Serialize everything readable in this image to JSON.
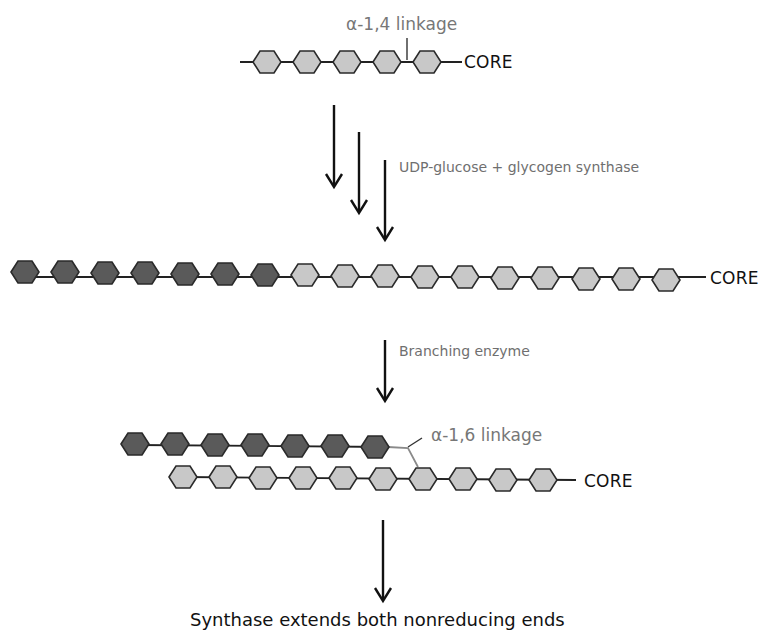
{
  "diagram": {
    "colors": {
      "new_residue": "#5a5a5a",
      "existing_residue": "#c8c8c8",
      "outline": "#2a2a2a",
      "bond": "#222222",
      "branch_bond": "#8a8a8a",
      "label_gray": "#6f6f6f"
    },
    "stage1": {
      "chain_label": "CORE",
      "linkage_label": "α-1,4 linkage",
      "existing_residues": 5,
      "new_residues": 0
    },
    "step1": {
      "label": "UDP-glucose + glycogen synthase",
      "arrow_count": 3
    },
    "stage2": {
      "chain_label": "CORE",
      "new_residues": 7,
      "existing_residues": 11
    },
    "step2": {
      "label": "Branching enzyme"
    },
    "stage3": {
      "chain_label": "CORE",
      "linkage_label": "α-1,6 linkage",
      "branch_new_residues": 7,
      "main_chain_residues": 10
    },
    "step3": {
      "label": "Synthase extends both nonreducing ends"
    }
  }
}
